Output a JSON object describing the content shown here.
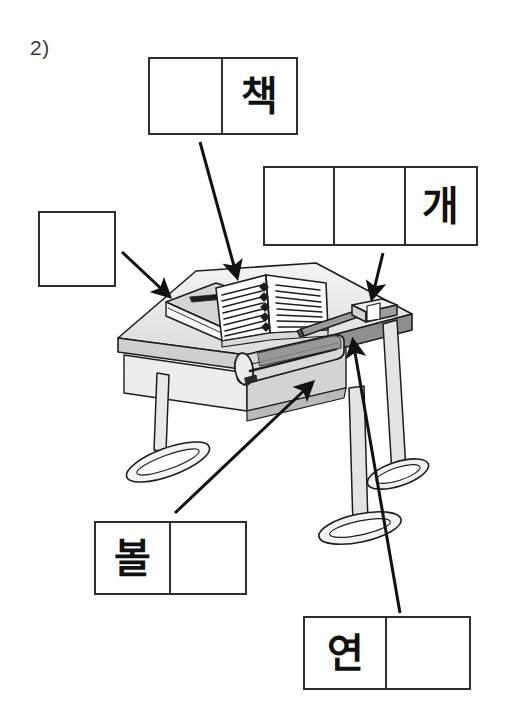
{
  "worksheet": {
    "question_number": "2)",
    "language": "Korean",
    "instruction_type": "label-the-picture"
  },
  "answer_boxes": [
    {
      "id": "chaek",
      "name": "answer-box-chaek",
      "cells": [
        "",
        "책"
      ],
      "filled_index": 1,
      "points_to": "open-book"
    },
    {
      "id": "gae",
      "name": "answer-box-gae",
      "cells": [
        "",
        "",
        "개"
      ],
      "filled_index": 2,
      "points_to": "eraser"
    },
    {
      "id": "blank",
      "name": "answer-box-blank",
      "cells": [
        ""
      ],
      "filled_index": -1,
      "points_to": "closed-notebook"
    },
    {
      "id": "bol",
      "name": "answer-box-bol",
      "cells": [
        "볼",
        ""
      ],
      "filled_index": 0,
      "points_to": "pencil-case"
    },
    {
      "id": "yeon",
      "name": "answer-box-yeon",
      "cells": [
        "연",
        ""
      ],
      "filled_index": 0,
      "points_to": "pencil"
    }
  ],
  "illustration": {
    "name": "desk-with-school-supplies",
    "objects": [
      {
        "name": "desk",
        "label": "desk"
      },
      {
        "name": "closed-notebook",
        "label": "closed notebook"
      },
      {
        "name": "open-book",
        "label": "open book"
      },
      {
        "name": "pencil-case",
        "label": "pencil case"
      },
      {
        "name": "pencil",
        "label": "pencil"
      },
      {
        "name": "eraser",
        "label": "eraser"
      }
    ]
  },
  "arrows": [
    {
      "name": "arrow-to-open-book",
      "from": "answer-box-chaek",
      "to": "open-book"
    },
    {
      "name": "arrow-to-eraser",
      "from": "answer-box-gae",
      "to": "eraser"
    },
    {
      "name": "arrow-to-closed-notebook",
      "from": "answer-box-blank",
      "to": "closed-notebook"
    },
    {
      "name": "arrow-to-pencil-case",
      "from": "answer-box-bol",
      "to": "pencil-case"
    },
    {
      "name": "arrow-to-pencil",
      "from": "answer-box-yeon",
      "to": "pencil"
    }
  ],
  "colors": {
    "line": "#2f2f2f",
    "ink": "#111111",
    "paper": "#ffffff",
    "shade_light": "#e2e2e2",
    "shade_mid": "#c9c9c9",
    "shade_dark": "#9a9a9a"
  }
}
